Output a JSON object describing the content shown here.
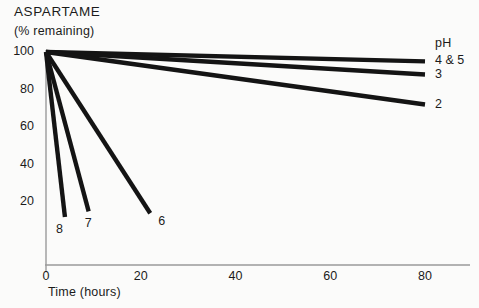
{
  "chart_data": {
    "type": "line",
    "title": "ASPARTAME",
    "subtitle": "(% remaining)",
    "ylabel": "(% remaining)",
    "xlabel": "Time (hours)",
    "xlim": [
      0,
      82
    ],
    "ylim": [
      0,
      104
    ],
    "grid": false,
    "legend_position": "right-end-of-lines",
    "legend_title": "pH",
    "xticks": [
      0,
      20,
      40,
      60,
      80
    ],
    "xtick_labels": [
      "0",
      "20",
      "40",
      "60",
      "80"
    ],
    "yticks": [
      20,
      40,
      60,
      80,
      100
    ],
    "ytick_labels": [
      "20",
      "40",
      "60",
      "80",
      "100"
    ],
    "line_color": "#141414",
    "axis_color": "#9a9a9a",
    "background": "#fbfbfa",
    "series": [
      {
        "name": "4 & 5",
        "label": "4 & 5",
        "x": [
          0,
          80
        ],
        "values": [
          100,
          95
        ]
      },
      {
        "name": "3",
        "label": "3",
        "x": [
          0,
          80
        ],
        "values": [
          100,
          88
        ]
      },
      {
        "name": "2",
        "label": "2",
        "x": [
          0,
          80
        ],
        "values": [
          100,
          72
        ]
      },
      {
        "name": "6",
        "label": "6",
        "x": [
          0,
          22
        ],
        "values": [
          100,
          14
        ]
      },
      {
        "name": "7",
        "label": "7",
        "x": [
          0,
          9
        ],
        "values": [
          100,
          15
        ]
      },
      {
        "name": "8",
        "label": "8",
        "x": [
          0,
          4
        ],
        "values": [
          100,
          12
        ]
      }
    ],
    "annotations": [
      {
        "text": "pH",
        "role": "legend-title"
      },
      {
        "text": "4 & 5",
        "role": "series-end-label"
      },
      {
        "text": "3",
        "role": "series-end-label"
      },
      {
        "text": "2",
        "role": "series-end-label"
      },
      {
        "text": "6",
        "role": "series-end-label"
      },
      {
        "text": "7",
        "role": "series-end-label"
      },
      {
        "text": "8",
        "role": "series-end-label"
      }
    ]
  }
}
